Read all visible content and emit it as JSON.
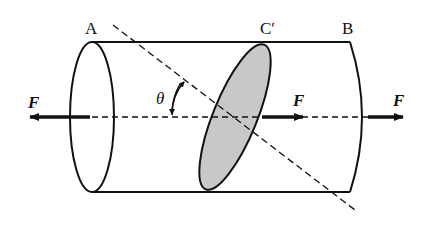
{
  "diagram": {
    "labels": {
      "point_a": "A",
      "point_c_prime": "C′",
      "point_b": "B",
      "force_left": "F",
      "force_middle": "F",
      "force_right": "F",
      "angle": "θ"
    },
    "colors": {
      "stroke": "#111111",
      "section_fill": "#c8c8c8",
      "background": "#ffffff"
    }
  }
}
